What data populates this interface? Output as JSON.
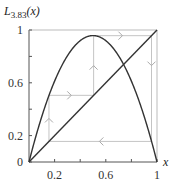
{
  "chart_data": {
    "type": "line",
    "title_parts": {
      "main": "L",
      "sub": "3.83",
      "arg": "(x)"
    },
    "xlabel": "x",
    "ylabel": "L_{3.83}(x)",
    "xlim": [
      0,
      1
    ],
    "ylim": [
      0,
      1
    ],
    "x_ticks": [
      0.2,
      0.4,
      0.6,
      0.8,
      1
    ],
    "x_tick_labels": [
      "0.2",
      "0.6",
      "1"
    ],
    "y_ticks": [
      0,
      0.2,
      0.4,
      0.6,
      0.8,
      1
    ],
    "y_tick_labels": [
      "0",
      "0.2",
      "0.6",
      "1"
    ],
    "grid": false,
    "series": [
      {
        "name": "L_{3.83}(x) = 3.83 x (1 - x)",
        "function": "3.83*x*(1-x)",
        "color": "#333333",
        "x": [
          0,
          0.1,
          0.2,
          0.3,
          0.4,
          0.5,
          0.6,
          0.7,
          0.8,
          0.9,
          1
        ],
        "values": [
          0,
          0.345,
          0.613,
          0.804,
          0.919,
          0.958,
          0.919,
          0.804,
          0.613,
          0.345,
          0
        ]
      },
      {
        "name": "y = x",
        "color": "#333333",
        "x": [
          0,
          1
        ],
        "values": [
          0,
          1
        ]
      }
    ],
    "cobweb": {
      "description": "period-3 orbit",
      "color": "#bbbbbb",
      "cycle_points": [
        0.156,
        0.505,
        0.957
      ],
      "arrows": [
        {
          "x": 0.156,
          "y": 0.33,
          "direction": "up"
        },
        {
          "x": 0.33,
          "y": 0.505,
          "direction": "right"
        },
        {
          "x": 0.505,
          "y": 0.73,
          "direction": "up"
        },
        {
          "x": 0.73,
          "y": 0.957,
          "direction": "right"
        },
        {
          "x": 0.957,
          "y": 0.73,
          "direction": "down"
        },
        {
          "x": 0.55,
          "y": 0.156,
          "direction": "left"
        }
      ]
    }
  }
}
